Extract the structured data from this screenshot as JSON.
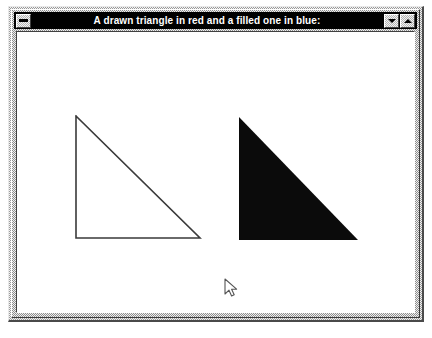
{
  "window": {
    "title": "A drawn triangle in red and a filled one in blue:",
    "sysmenu_label": "",
    "minimize_label": "",
    "maximize_label": "",
    "icons": {
      "sysmenu": "system-menu-bar-icon",
      "minimize": "triangle-down-icon",
      "maximize": "triangle-up-icon"
    }
  },
  "canvas": {
    "background_color": "#ffffff",
    "shapes": [
      {
        "name": "outlined-triangle",
        "kind": "polyline-triangle",
        "style": "stroked",
        "stroke_color": "#3a3a3a",
        "fill_color": "none",
        "stroke_width": 1.6,
        "points": "74,114 198,236 74,236 74,114"
      },
      {
        "name": "filled-triangle",
        "kind": "polygon-triangle",
        "style": "filled",
        "stroke_color": "none",
        "fill_color": "#0b0b0b",
        "stroke_width": 0,
        "points": "237,115 356,238 237,238"
      }
    ],
    "cursor": {
      "name": "arrow-pointer",
      "x": 222,
      "y": 276,
      "color": "#555555"
    }
  }
}
